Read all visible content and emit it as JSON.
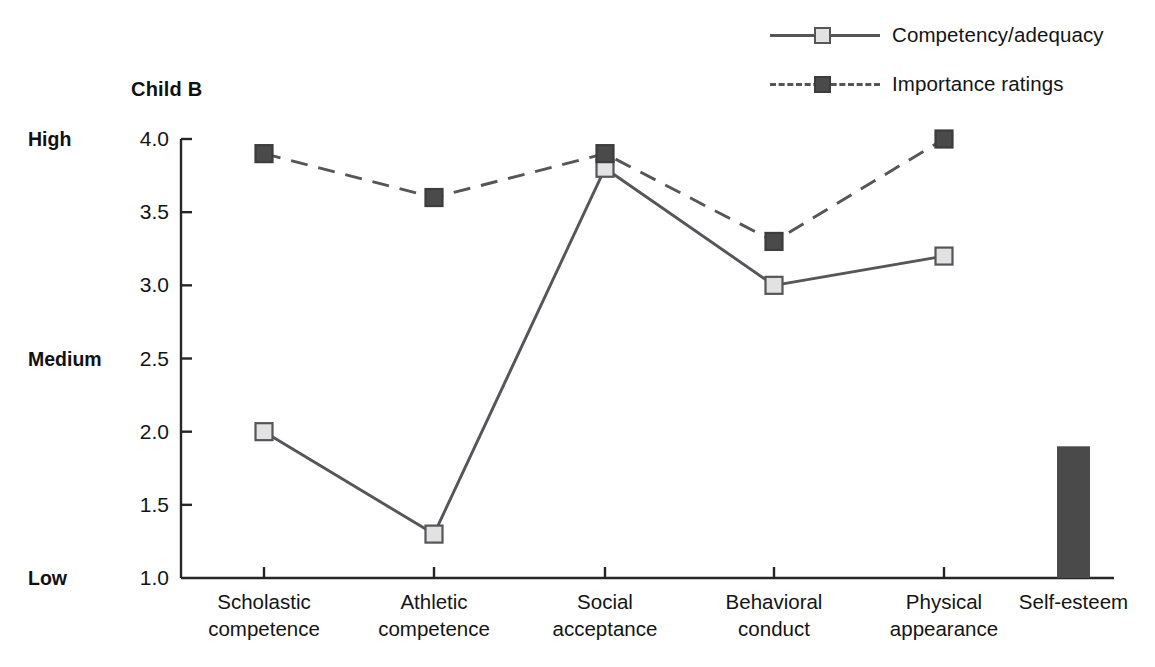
{
  "chart_data": {
    "type": "line",
    "title": "Child B",
    "xlabel": "",
    "ylabel": "",
    "ylim": [
      1.0,
      4.0
    ],
    "grid": false,
    "legend_position": "top-right",
    "categories": [
      "Scholastic competence",
      "Athletic competence",
      "Social acceptance",
      "Behavioral conduct",
      "Physical appearance"
    ],
    "category_lines": [
      [
        "Scholastic",
        "competence"
      ],
      [
        "Athletic",
        "competence"
      ],
      [
        "Social",
        "acceptance"
      ],
      [
        "Behavioral",
        "conduct"
      ],
      [
        "Physical",
        "appearance"
      ]
    ],
    "series": [
      {
        "name": "Competency/adequacy",
        "style": "solid",
        "marker": "square-light",
        "values": [
          2.0,
          1.3,
          3.8,
          3.0,
          3.2
        ]
      },
      {
        "name": "Importance ratings",
        "style": "dashed",
        "marker": "square-dark",
        "values": [
          3.9,
          3.6,
          3.9,
          3.3,
          4.0
        ]
      }
    ],
    "bar": {
      "label": "Self-esteem",
      "value": 1.9,
      "color": "#4a4a4a"
    },
    "y_ticks": [
      {
        "value": 4.0,
        "label": "4.0",
        "band": "High"
      },
      {
        "value": 3.5,
        "label": "3.5",
        "band": ""
      },
      {
        "value": 3.0,
        "label": "3.0",
        "band": ""
      },
      {
        "value": 2.5,
        "label": "2.5",
        "band": "Medium"
      },
      {
        "value": 2.0,
        "label": "2.0",
        "band": ""
      },
      {
        "value": 1.5,
        "label": "1.5",
        "band": ""
      },
      {
        "value": 1.0,
        "label": "1.0",
        "band": "Low"
      }
    ],
    "colors": {
      "line": "#55555a",
      "marker_light_fill": "#e2e2e2",
      "marker_dark_fill": "#4a4a4a",
      "axis": "#262626",
      "bar": "#4a4a4a",
      "background": "#ffffff"
    }
  },
  "legend": {
    "items": [
      {
        "label": "Competency/adequacy",
        "style": "solid",
        "marker": "light"
      },
      {
        "label": "Importance ratings",
        "style": "dashed",
        "marker": "dark"
      }
    ]
  }
}
